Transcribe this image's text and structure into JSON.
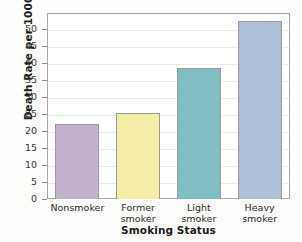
{
  "chart_data": {
    "type": "bar",
    "title": "",
    "xlabel": "Smoking Status",
    "ylabel": "Death Rate per 1000",
    "categories": [
      "Nonsmoker",
      "Former smoker",
      "Light smoker",
      "Heavy smoker"
    ],
    "category_lines": [
      [
        "Nonsmoker"
      ],
      [
        "Former",
        "smoker"
      ],
      [
        "Light",
        "smoker"
      ],
      [
        "Heavy",
        "smoker"
      ]
    ],
    "values": [
      22.2,
      25.3,
      38.7,
      52.5
    ],
    "bar_colors": [
      "#c2b0cc",
      "#f5eca6",
      "#7fbec0",
      "#aebfd6"
    ],
    "ylim": [
      0,
      55
    ],
    "ytick_values": [
      0,
      5,
      10,
      15,
      20,
      25,
      30,
      35,
      40,
      45,
      50
    ],
    "ytick_labels": [
      "0",
      "5",
      "10",
      "15",
      "20",
      "25",
      "30",
      "35",
      "40",
      "45",
      "50"
    ],
    "grid": true,
    "grid_axis": "y",
    "legend": false,
    "legend_position": "none",
    "series": [
      {
        "name": "Death Rate per 1000",
        "values": [
          22.2,
          25.3,
          38.7,
          52.5
        ]
      }
    ]
  },
  "figure": {
    "background_color": "#ffffff",
    "axis_border_color": "#a8a8a8",
    "gridline_color": "#ececec",
    "bar_border_color": "#9a9a9a"
  }
}
